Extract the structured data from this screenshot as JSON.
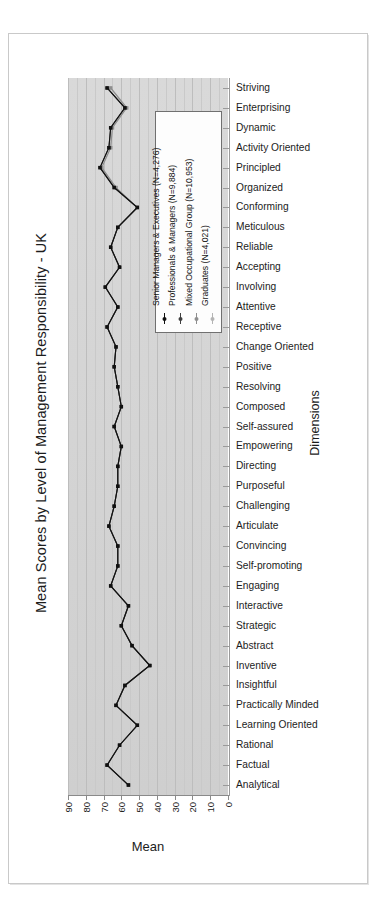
{
  "figure": {
    "title": "Mean Scores by Level of Management Responsibility - UK",
    "x_axis_title": "Mean",
    "y_axis_title": "Dimensions"
  },
  "legend": {
    "entries": [
      {
        "label": "Senior Managers & Executives (N=4,276)",
        "color": "#101010",
        "marker": "filled-circle"
      },
      {
        "label": "Professionals & Managers (N=9,884)",
        "color": "#3f3f3f",
        "marker": "filled-circle"
      },
      {
        "label": "Mixed Occupational Group (N=10,953)",
        "color": "#8e8e8e",
        "marker": "filled-circle"
      },
      {
        "label": "Graduates (N=4,021)",
        "color": "#b4b4b4",
        "marker": "filled-circle"
      }
    ]
  },
  "chart_data": {
    "type": "line",
    "title": "Mean Scores by Level of Management Responsibility - UK",
    "xlabel": "Mean",
    "ylabel": "Dimensions",
    "orientation": "horizontal",
    "grid": true,
    "legend_position": "inside-right-upper",
    "xlim": [
      90,
      0
    ],
    "x_reversed": true,
    "xticks": [
      90,
      80,
      70,
      60,
      50,
      40,
      30,
      20,
      10,
      0
    ],
    "categories": [
      "Striving",
      "Enterprising",
      "Dynamic",
      "Activity Oriented",
      "Principled",
      "Organized",
      "Conforming",
      "Meticulous",
      "Reliable",
      "Accepting",
      "Involving",
      "Attentive",
      "Receptive",
      "Change Oriented",
      "Positive",
      "Resolving",
      "Composed",
      "Self-assured",
      "Empowering",
      "Directing",
      "Purposeful",
      "Challenging",
      "Articulate",
      "Convincing",
      "Self-promoting",
      "Engaging",
      "Interactive",
      "Strategic",
      "Abstract",
      "Inventive",
      "Insightful",
      "Practically Minded",
      "Learning Oriented",
      "Rational",
      "Factual",
      "Analytical"
    ],
    "series": [
      {
        "name": "Senior Managers & Executives (N=4,276)",
        "color": "#101010",
        "values": [
          68,
          58,
          66,
          67,
          72,
          64,
          51,
          62,
          66,
          61,
          69,
          62,
          68,
          63,
          64,
          62,
          60,
          64,
          60,
          62,
          62,
          64,
          67,
          62,
          62,
          66,
          56,
          60,
          54,
          44,
          58,
          63,
          51,
          61,
          68,
          56
        ]
      },
      {
        "name": "Professionals & Managers (N=9,884)",
        "color": "#3f3f3f",
        "values": [
          68,
          58,
          66,
          67,
          72,
          64,
          51,
          62,
          66,
          61,
          69,
          62,
          68,
          63,
          64,
          62,
          60,
          64,
          60,
          62,
          62,
          64,
          67,
          62,
          62,
          66,
          56,
          60,
          54,
          44,
          58,
          63,
          51,
          61,
          68,
          56
        ]
      },
      {
        "name": "Mixed Occupational Group (N=10,953)",
        "color": "#8e8e8e",
        "values": [
          66,
          57,
          65,
          66,
          71,
          63,
          51,
          62,
          66,
          61,
          69,
          62,
          68,
          63,
          64,
          62,
          60,
          64,
          60,
          62,
          62,
          64,
          67,
          62,
          62,
          66,
          56,
          60,
          54,
          44,
          58,
          63,
          51,
          61,
          68,
          56
        ]
      },
      {
        "name": "Graduates (N=4,021)",
        "color": "#b4b4b4",
        "values": [
          66,
          57,
          65,
          66,
          71,
          63,
          51,
          62,
          66,
          61,
          69,
          62,
          68,
          63,
          64,
          62,
          60,
          64,
          60,
          62,
          62,
          64,
          67,
          62,
          62,
          66,
          56,
          60,
          54,
          44,
          58,
          63,
          51,
          61,
          68,
          56
        ]
      }
    ]
  }
}
